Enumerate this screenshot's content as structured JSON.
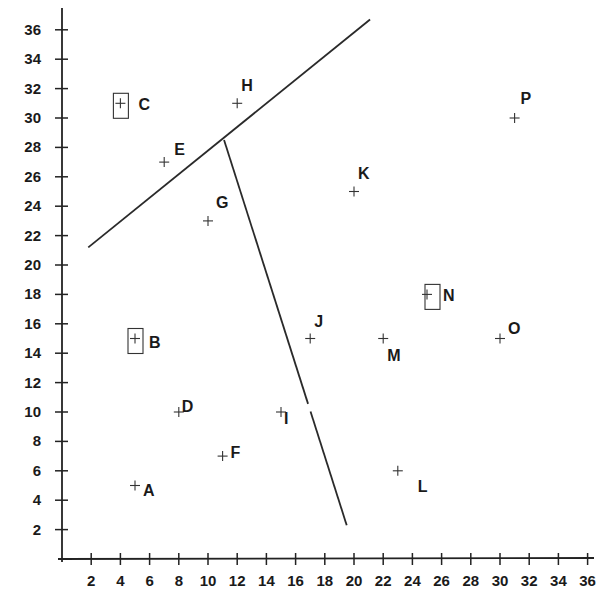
{
  "chart_data": {
    "type": "scatter",
    "title": "",
    "xlabel": "",
    "ylabel": "",
    "xlim": [
      0,
      36
    ],
    "ylim": [
      0,
      36
    ],
    "grid": false,
    "legend": null,
    "x_ticks": [
      2,
      4,
      6,
      8,
      10,
      12,
      14,
      16,
      18,
      20,
      22,
      24,
      26,
      28,
      30,
      32,
      34,
      36
    ],
    "y_ticks": [
      2,
      4,
      6,
      8,
      10,
      12,
      14,
      16,
      18,
      20,
      22,
      24,
      26,
      28,
      30,
      32,
      34,
      36
    ],
    "points": [
      {
        "label": "A",
        "x": 5,
        "y": 5,
        "boxed": false
      },
      {
        "label": "B",
        "x": 5,
        "y": 15,
        "boxed": true
      },
      {
        "label": "C",
        "x": 4,
        "y": 31,
        "boxed": true
      },
      {
        "label": "D",
        "x": 8,
        "y": 10,
        "boxed": false
      },
      {
        "label": "E",
        "x": 7,
        "y": 27,
        "boxed": false
      },
      {
        "label": "F",
        "x": 11,
        "y": 7,
        "boxed": false
      },
      {
        "label": "G",
        "x": 10,
        "y": 23,
        "boxed": false
      },
      {
        "label": "H",
        "x": 12,
        "y": 31,
        "boxed": false
      },
      {
        "label": "I",
        "x": 15,
        "y": 10,
        "boxed": false
      },
      {
        "label": "J",
        "x": 17,
        "y": 15,
        "boxed": false
      },
      {
        "label": "K",
        "x": 20,
        "y": 25,
        "boxed": false
      },
      {
        "label": "L",
        "x": 23,
        "y": 6,
        "boxed": false
      },
      {
        "label": "M",
        "x": 22,
        "y": 15,
        "boxed": false
      },
      {
        "label": "N",
        "x": 25,
        "y": 18,
        "boxed": true
      },
      {
        "label": "O",
        "x": 30,
        "y": 15,
        "boxed": false
      },
      {
        "label": "P",
        "x": 31,
        "y": 30,
        "boxed": false
      }
    ],
    "boundary_lines": [
      {
        "name": "upper-boundary",
        "from": [
          1.8,
          21.2
        ],
        "to": [
          21.1,
          36.7
        ]
      },
      {
        "name": "lower-boundary",
        "from": [
          11.1,
          28.5
        ],
        "to": [
          19.5,
          2.3
        ]
      }
    ]
  }
}
